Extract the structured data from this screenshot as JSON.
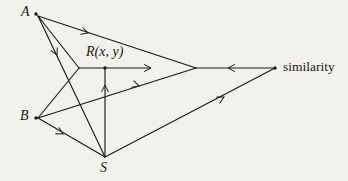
{
  "figure": {
    "type": "geometry-vector-diagram",
    "background_color": "#f3f1ec",
    "ink_color": "#1a1a1a",
    "width": 348,
    "height": 181
  },
  "nodes": [
    {
      "id": "A",
      "label": "A",
      "style": "italic",
      "x": 36,
      "y": 14,
      "label_x": 21,
      "label_y": 7,
      "dot": true
    },
    {
      "id": "B",
      "label": "B",
      "style": "italic",
      "x": 36,
      "y": 118,
      "label_x": 20,
      "label_y": 111,
      "dot": true
    },
    {
      "id": "S",
      "label": "S",
      "style": "italic",
      "x": 105,
      "y": 157,
      "label_x": 100,
      "label_y": 161,
      "dot": false
    },
    {
      "id": "R",
      "label": "R(x, y)",
      "style": "point",
      "x": 105,
      "y": 68,
      "label_x": 86,
      "label_y": 46,
      "dot": true
    },
    {
      "id": "similarity",
      "label": "similarity",
      "style": "roman",
      "x": 275,
      "y": 68,
      "label_x": 283,
      "label_y": 61,
      "dot": true
    },
    {
      "id": "V1",
      "label": "",
      "style": "none",
      "x": 79,
      "y": 68,
      "label_x": 0,
      "label_y": 0,
      "dot": false
    },
    {
      "id": "V2",
      "label": "",
      "style": "none",
      "x": 196,
      "y": 68,
      "label_x": 0,
      "label_y": 0,
      "dot": false
    }
  ],
  "edges": [
    {
      "name": "edge-vertex2-to-A",
      "from": "V2",
      "to": "A",
      "x1": 196,
      "y1": 68,
      "x2": 38,
      "y2": 16,
      "arrow_at": 0.68,
      "arrow_dir": "toward-A"
    },
    {
      "name": "edge-A-to-vertex1",
      "from": "A",
      "to": "V1",
      "x1": 38,
      "y1": 16,
      "x2": 79,
      "y2": 68,
      "arrow_at": null,
      "arrow_dir": "none"
    },
    {
      "name": "edge-S-to-A",
      "from": "S",
      "to": "A",
      "x1": 105,
      "y1": 157,
      "x2": 38,
      "y2": 16,
      "arrow_at": 0.72,
      "arrow_dir": "toward-A"
    },
    {
      "name": "edge-A-to-S",
      "from": "A",
      "to": "S",
      "x1": 38,
      "y1": 16,
      "x2": 105,
      "y2": 157,
      "arrow_at": null,
      "arrow_dir": "none"
    },
    {
      "name": "edge-R-horizontal-right",
      "from": "R",
      "to": "right",
      "x1": 79,
      "y1": 68,
      "x2": 152,
      "y2": 68,
      "arrow_at": 1.0,
      "arrow_dir": "right"
    },
    {
      "name": "edge-S-to-R-vertical",
      "from": "S",
      "to": "R",
      "x1": 105,
      "y1": 157,
      "x2": 105,
      "y2": 68,
      "arrow_at": 0.8,
      "arrow_dir": "up"
    },
    {
      "name": "edge-B-to-vertex1",
      "from": "B",
      "to": "V1",
      "x1": 38,
      "y1": 118,
      "x2": 79,
      "y2": 68,
      "arrow_at": null,
      "arrow_dir": "none"
    },
    {
      "name": "edge-vertex2-to-B",
      "from": "V2",
      "to": "B",
      "x1": 196,
      "y1": 68,
      "x2": 38,
      "y2": 118,
      "arrow_at": 0.36,
      "arrow_dir": "toward-B"
    },
    {
      "name": "edge-S-to-B",
      "from": "S",
      "to": "B",
      "x1": 105,
      "y1": 157,
      "x2": 38,
      "y2": 118,
      "arrow_at": 0.62,
      "arrow_dir": "toward-B"
    },
    {
      "name": "edge-S-to-vertex2",
      "from": "S",
      "to": "V2",
      "x1": 105,
      "y1": 157,
      "x2": 275,
      "y2": 68,
      "arrow_at": 0.7,
      "arrow_dir": "up-right"
    },
    {
      "name": "edge-similarity-to-vertex2",
      "from": "similarity",
      "to": "V2",
      "x1": 275,
      "y1": 68,
      "x2": 196,
      "y2": 68,
      "arrow_at": 0.6,
      "arrow_dir": "left"
    }
  ]
}
